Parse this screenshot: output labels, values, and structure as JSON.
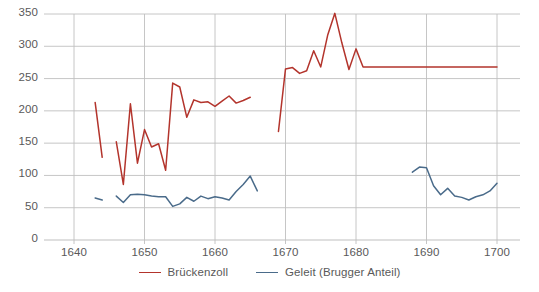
{
  "chart_data": {
    "type": "line",
    "title": "",
    "subtitle": "",
    "xlabel": "",
    "ylabel": "",
    "xlim": [
      1638,
      1701
    ],
    "ylim": [
      0,
      360
    ],
    "grid": true,
    "grid_axis": "both",
    "legend_position": "bottom",
    "yticks": [
      0,
      50,
      100,
      150,
      200,
      250,
      300,
      350
    ],
    "ytick_labels": [
      "0",
      "50",
      "100",
      "150",
      "200",
      "250",
      "300",
      "350"
    ],
    "xticks": [
      1640,
      1650,
      1660,
      1670,
      1680,
      1690,
      1700
    ],
    "xtick_labels": [
      "1640",
      "1650",
      "1660",
      "1670",
      "1680",
      "1690",
      "1700"
    ],
    "colors": {
      "brueckenzoll": "#B3342C",
      "geleit": "#4A6B8A",
      "gridline": "#BFBFBF",
      "axis_text": "#595959",
      "background": "#FFFFFF"
    },
    "series": [
      {
        "name": "Brückenzoll",
        "color": "#B3342C",
        "segments": [
          {
            "x": [
              1643,
              1644
            ],
            "y": [
              213,
              128
            ]
          },
          {
            "x": [
              1646,
              1647,
              1648,
              1649,
              1650,
              1651,
              1652,
              1653,
              1654,
              1655,
              1656,
              1657,
              1658,
              1659,
              1660,
              1661,
              1662,
              1663,
              1664,
              1665
            ],
            "y": [
              152,
              86,
              211,
              119,
              171,
              144,
              149,
              108,
              243,
              237,
              190,
              217,
              213,
              214,
              207,
              215,
              223,
              212,
              216,
              221
            ]
          },
          {
            "x": [
              1669,
              1670,
              1671,
              1672,
              1673,
              1674,
              1675,
              1676,
              1677,
              1678,
              1679,
              1680,
              1681,
              1690,
              1700
            ],
            "y": [
              168,
              265,
              267,
              258,
              262,
              293,
              268,
              318,
              351,
              305,
              264,
              296,
              268,
              268,
              268
            ]
          }
        ]
      },
      {
        "name": "Geleit (Brugger Anteil)",
        "color": "#4A6B8A",
        "segments": [
          {
            "x": [
              1643,
              1644
            ],
            "y": [
              65,
              62
            ]
          },
          {
            "x": [
              1646,
              1647,
              1648,
              1649,
              1650,
              1651,
              1652,
              1653,
              1654,
              1655,
              1656,
              1657,
              1658,
              1659,
              1660,
              1661,
              1662,
              1663,
              1664,
              1665,
              1666
            ],
            "y": [
              68,
              58,
              70,
              71,
              70,
              68,
              67,
              67,
              52,
              56,
              66,
              60,
              68,
              64,
              67,
              65,
              62,
              75,
              86,
              99,
              76
            ]
          },
          {
            "x": [
              1688,
              1689,
              1690,
              1691,
              1692,
              1693,
              1694,
              1695,
              1696,
              1697,
              1698,
              1699,
              1700
            ],
            "y": [
              105,
              113,
              112,
              84,
              70,
              80,
              68,
              66,
              62,
              67,
              70,
              76,
              88
            ]
          }
        ]
      }
    ]
  },
  "legend": {
    "items": [
      {
        "label": "Brückenzoll",
        "color": "#B3342C"
      },
      {
        "label": "Geleit (Brugger Anteil)",
        "color": "#4A6B8A"
      }
    ]
  }
}
